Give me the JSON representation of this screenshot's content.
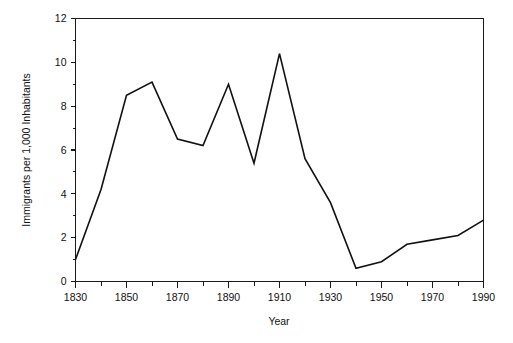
{
  "chart_data": {
    "type": "line",
    "title": "",
    "xlabel": "Year",
    "ylabel": "Immigrants per 1,000 Inhabitants",
    "xlim": [
      1830,
      1990
    ],
    "ylim": [
      0,
      12
    ],
    "grid": false,
    "legend": "none",
    "x_ticks_major": [
      1830,
      1850,
      1870,
      1890,
      1910,
      1930,
      1950,
      1970,
      1990
    ],
    "x_tick_labels": [
      "1830",
      "1850",
      "1870",
      "1890",
      "1910",
      "1930",
      "1950",
      "1970",
      "1990"
    ],
    "x_ticks_minor": [
      1840,
      1860,
      1880,
      1900,
      1920,
      1940,
      1960,
      1980
    ],
    "y_ticks_major": [
      0,
      2,
      4,
      6,
      8,
      10,
      12
    ],
    "y_tick_labels": [
      "0",
      "2",
      "4",
      "6",
      "8",
      "10",
      "12"
    ],
    "y_ticks_minor": [
      1,
      3,
      5,
      7,
      9,
      11
    ],
    "x": [
      1830,
      1840,
      1850,
      1860,
      1870,
      1880,
      1890,
      1900,
      1910,
      1920,
      1930,
      1940,
      1950,
      1960,
      1970,
      1980,
      1990
    ],
    "values": [
      1.0,
      4.2,
      8.5,
      9.1,
      6.5,
      6.2,
      9.0,
      5.4,
      10.4,
      5.6,
      3.6,
      0.6,
      0.9,
      1.7,
      1.9,
      2.1,
      2.8
    ],
    "series": [
      {
        "name": "Immigration rate",
        "color": "#111111",
        "values": [
          1.0,
          4.2,
          8.5,
          9.1,
          6.5,
          6.2,
          9.0,
          5.4,
          10.4,
          5.6,
          3.6,
          0.6,
          0.9,
          1.7,
          1.9,
          2.1,
          2.8
        ]
      }
    ]
  },
  "colors": {
    "line": "#111111",
    "axis": "#1a1a1a",
    "background": "#ffffff"
  }
}
